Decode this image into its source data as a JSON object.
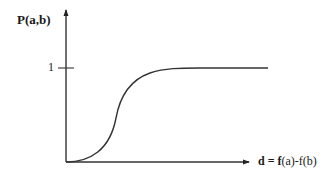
{
  "diagram": {
    "type": "sigmoid-probability-plot",
    "y_axis": {
      "label": "P(a,b)",
      "tick_label": "1"
    },
    "x_axis": {
      "label_bold": "d = f",
      "label_rest": "(a)-f(b)"
    },
    "curve": {
      "shape": "sigmoid",
      "start": "origin",
      "asymptote": "1"
    },
    "colors": {
      "stroke": "#333333",
      "text": "#1a1a1a",
      "background": "#ffffff"
    }
  }
}
